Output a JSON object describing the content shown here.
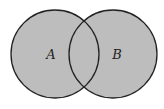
{
  "diagram": {
    "type": "venn",
    "sets": [
      {
        "label": "A",
        "cx": 55,
        "cy": 54,
        "r": 44
      },
      {
        "label": "B",
        "cx": 113,
        "cy": 54,
        "r": 44
      }
    ],
    "colors": {
      "fill": "#bdbdbd",
      "stroke": "#222222",
      "background": "#ffffff"
    }
  }
}
